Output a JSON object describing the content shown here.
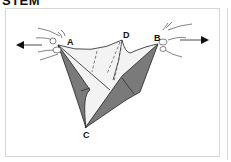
{
  "heading": "STEM",
  "diagram": {
    "labels": {
      "a": "A",
      "b": "B",
      "c": "C",
      "d": "D"
    },
    "icons": {
      "left_arrow": "arrow-left-icon",
      "right_arrow": "arrow-right-icon",
      "left_hand": "hand-icon",
      "right_hand": "hand-icon"
    },
    "colors": {
      "fold_dark": "#7a7a7a",
      "fold_light": "#f2f2f2",
      "line": "#222222",
      "frame": "#d6d6d6"
    }
  }
}
